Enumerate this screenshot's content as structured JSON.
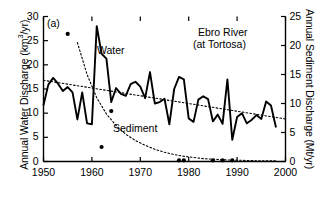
{
  "figure": {
    "panel_label": "(a)",
    "title_line1": "Ebro River",
    "title_line2": "(at Tortosa)",
    "series_label_water": "Water",
    "series_label_sediment": "Sediment"
  },
  "axes": {
    "left": {
      "label_prefix": "Annual Water Discharge (km",
      "label_exponent": "3",
      "label_suffix": "/yr)",
      "ticks": [
        "0",
        "5",
        "10",
        "15",
        "20",
        "25",
        "30"
      ],
      "min": 0,
      "max": 30
    },
    "right": {
      "label": "Annual Sediment Discharge (Mt/yr)",
      "ticks": [
        "0",
        "5",
        "10",
        "15",
        "20",
        "25"
      ],
      "min": 0,
      "max": 25
    },
    "bottom": {
      "ticks": [
        "1950",
        "1960",
        "1970",
        "1980",
        "1990",
        "2000"
      ],
      "min": 1950,
      "max": 2000
    }
  },
  "colors": {
    "line": "#000000",
    "axis": "#000000",
    "background": "#ffffff",
    "trend": "#000000"
  },
  "chart_data": {
    "type": "line",
    "title": "Ebro River (at Tortosa)",
    "xlabel": "",
    "ylabel": "Annual Water Discharge (km3/yr)",
    "ylabel_right": "Annual Sediment Discharge (Mt/yr)",
    "xlim": [
      1950,
      2000
    ],
    "ylim": [
      0,
      30
    ],
    "ylim_right": [
      0,
      25
    ],
    "grid": false,
    "legend": "inline-annotations",
    "series": [
      {
        "name": "Water",
        "type": "line",
        "axis": "left",
        "units": "km3/yr",
        "x": [
          1950,
          1951,
          1952,
          1953,
          1954,
          1955,
          1956,
          1957,
          1958,
          1959,
          1960,
          1961,
          1962,
          1963,
          1964,
          1965,
          1966,
          1967,
          1968,
          1969,
          1970,
          1971,
          1972,
          1973,
          1974,
          1975,
          1976,
          1977,
          1978,
          1979,
          1980,
          1981,
          1982,
          1983,
          1984,
          1985,
          1986,
          1987,
          1988,
          1989,
          1990,
          1991,
          1992,
          1993,
          1994,
          1995,
          1996,
          1997,
          1998
        ],
        "values": [
          11.7,
          15.9,
          17.3,
          16.1,
          14.6,
          15.4,
          14.3,
          8.7,
          14.3,
          7.9,
          7.7,
          28.0,
          22.3,
          21.3,
          12.3,
          15.2,
          14.0,
          13.6,
          16.0,
          16.5,
          15.5,
          13.1,
          18.5,
          12.0,
          12.3,
          13.0,
          7.7,
          15.0,
          17.5,
          17.0,
          8.9,
          8.2,
          12.8,
          13.5,
          12.9,
          8.3,
          9.7,
          7.8,
          17.0,
          4.5,
          9.2,
          10.0,
          7.9,
          8.6,
          9.6,
          8.8,
          12.4,
          11.6,
          7.2
        ]
      },
      {
        "name": "Sediment",
        "type": "scatter",
        "axis": "right",
        "units": "Mt/yr",
        "x": [
          1955,
          1962,
          1964,
          1978,
          1979,
          1985,
          1987,
          1989
        ],
        "values": [
          22.0,
          2.5,
          8.7,
          0.2,
          0.2,
          0.2,
          0.2,
          0.2
        ]
      },
      {
        "name": "Water trend",
        "type": "line-dotted",
        "axis": "left",
        "x": [
          1950,
          2000
        ],
        "values": [
          16.8,
          8.8
        ]
      },
      {
        "name": "Sediment trend",
        "type": "line-dotted",
        "axis": "right",
        "x": [
          1957,
          1959,
          1961,
          1963,
          1965,
          1967,
          1969,
          1971,
          1973,
          1975,
          1977,
          1979,
          1981,
          1983,
          1985,
          1987,
          1989,
          1991,
          1993,
          1995,
          1997,
          1998
        ],
        "values": [
          20.5,
          15.0,
          11.0,
          8.2,
          6.2,
          4.7,
          3.6,
          2.8,
          2.1,
          1.6,
          1.2,
          0.9,
          0.7,
          0.5,
          0.4,
          0.3,
          0.25,
          0.2,
          0.15,
          0.12,
          0.1,
          0.1
        ]
      }
    ]
  }
}
